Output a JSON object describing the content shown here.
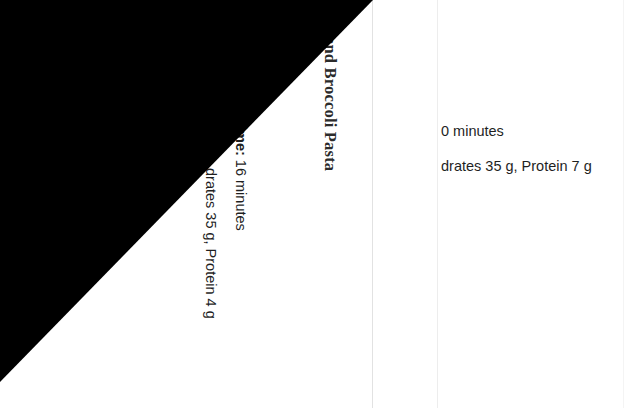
{
  "document": {
    "left_page": {
      "recipe_title": "and Broccoli Pasta",
      "cook_time_label": "ime:",
      "cook_time_value": " 16 minutes",
      "nutrition": "drates 35 g, Protein 4 g",
      "footer": {
        "word": "P a g e ",
        "separator": "| ",
        "number": "9"
      }
    },
    "right_page": {
      "line_1": "0 minutes",
      "line_2": "drates 35 g, Protein 7 g"
    }
  },
  "overlay": {
    "shape": "black-triangle",
    "color": "#000000"
  },
  "colors": {
    "background": "#ffffff",
    "body_text": "#1f1f1f",
    "title_text": "#2b2b2b",
    "footer_text": "#6f6f6f",
    "page_edge": "#e2e2e2"
  }
}
